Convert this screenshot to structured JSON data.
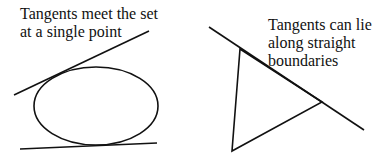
{
  "diagram": {
    "left_panel": {
      "caption_lines": [
        "Tangents meet the set",
        "at a single point"
      ],
      "shape": "ellipse",
      "ellipse": {
        "cx": 96,
        "cy": 106,
        "rx": 62,
        "ry": 39
      },
      "tangent_lines": [
        {
          "x1": 14,
          "y1": 95,
          "x2": 149,
          "y2": 31
        },
        {
          "x1": 20,
          "y1": 149,
          "x2": 157,
          "y2": 143
        }
      ]
    },
    "right_panel": {
      "caption_lines": [
        "Tangents can lie",
        "along straight",
        "boundaries"
      ],
      "shape": "triangle",
      "triangle_points": [
        [
          240,
          49
        ],
        [
          232,
          151
        ],
        [
          322,
          102
        ]
      ],
      "tangent_lines": [
        {
          "x1": 209,
          "y1": 27,
          "x2": 364,
          "y2": 130
        }
      ]
    },
    "colors": {
      "stroke": "#111111",
      "background": "#ffffff"
    }
  }
}
